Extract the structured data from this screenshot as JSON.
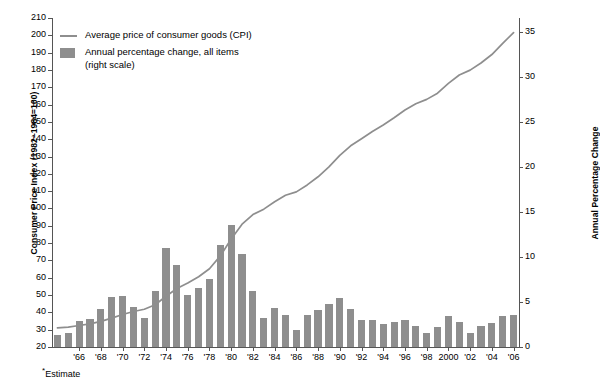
{
  "chart_data": {
    "type": "line",
    "title": "",
    "xlabel": "",
    "ylabel": "Consumer Price Index (1982–1984=100)",
    "y2label": "Annual Percentage Change",
    "ylim": [
      20,
      210
    ],
    "y2lim": [
      0,
      36.5
    ],
    "xlim": [
      1964,
      2006
    ],
    "grid": false,
    "legend_position": "top-left",
    "left_ticks": [
      210,
      200,
      190,
      180,
      170,
      160,
      150,
      140,
      130,
      120,
      110,
      100,
      90,
      80,
      70,
      60,
      50,
      40,
      30,
      20
    ],
    "right_ticks": [
      35,
      30,
      25,
      20,
      15,
      10,
      5,
      0
    ],
    "x_tick_labels": [
      "'66",
      "'68",
      "'70",
      "'72",
      "'74",
      "'76",
      "'78",
      "'80",
      "'82",
      "'84",
      "'86",
      "'88",
      "'90",
      "'92",
      "'94",
      "'96",
      "'98",
      "2000",
      "'02",
      "'04",
      "'06"
    ],
    "x_tick_years": [
      1966,
      1968,
      1970,
      1972,
      1974,
      1976,
      1978,
      1980,
      1982,
      1984,
      1986,
      1988,
      1990,
      1992,
      1994,
      1996,
      1998,
      2000,
      2002,
      2004,
      2006
    ],
    "x": [
      1964,
      1965,
      1966,
      1967,
      1968,
      1969,
      1970,
      1971,
      1972,
      1973,
      1974,
      1975,
      1976,
      1977,
      1978,
      1979,
      1980,
      1981,
      1982,
      1983,
      1984,
      1985,
      1986,
      1987,
      1988,
      1989,
      1990,
      1991,
      1992,
      1993,
      1994,
      1995,
      1996,
      1997,
      1998,
      1999,
      2000,
      2001,
      2002,
      2003,
      2004,
      2005,
      2006
    ],
    "series": [
      {
        "name": "Average price of consumer goods (CPI)",
        "axis": "left",
        "type": "line",
        "color": "#8e8e8e",
        "values": [
          31.0,
          31.5,
          32.4,
          33.4,
          34.8,
          36.7,
          38.8,
          40.5,
          41.8,
          44.4,
          49.3,
          53.8,
          56.9,
          60.6,
          65.2,
          72.6,
          82.4,
          90.9,
          96.5,
          99.6,
          103.9,
          107.6,
          109.6,
          113.6,
          118.3,
          124.0,
          130.7,
          136.2,
          140.3,
          144.5,
          148.2,
          152.4,
          156.9,
          160.5,
          163.0,
          166.6,
          172.2,
          177.1,
          179.9,
          184.0,
          188.9,
          195.3,
          201.6
        ]
      },
      {
        "name": "Annual percentage change, all items (right scale)",
        "axis": "right",
        "type": "bar",
        "color": "#8e8e8e",
        "values": [
          1.3,
          1.6,
          2.9,
          3.1,
          4.2,
          5.5,
          5.7,
          4.4,
          3.2,
          6.2,
          11.0,
          9.1,
          5.8,
          6.5,
          7.6,
          11.3,
          13.5,
          10.3,
          6.2,
          3.2,
          4.3,
          3.6,
          1.9,
          3.6,
          4.1,
          4.8,
          5.4,
          4.2,
          3.0,
          3.0,
          2.6,
          2.8,
          3.0,
          2.3,
          1.6,
          2.2,
          3.4,
          2.8,
          1.6,
          2.3,
          2.7,
          3.4,
          3.6
        ]
      }
    ]
  },
  "legend": {
    "line_label": "Average price of consumer goods (CPI)",
    "bar_label": "Annual percentage change, all items",
    "bar_label_line2": "(right scale)"
  },
  "footnote": {
    "marker": "*",
    "text": "Estimate"
  },
  "colors": {
    "series": "#8e8e8e",
    "axis": "#555555",
    "text": "#000000",
    "background": "#ffffff"
  }
}
